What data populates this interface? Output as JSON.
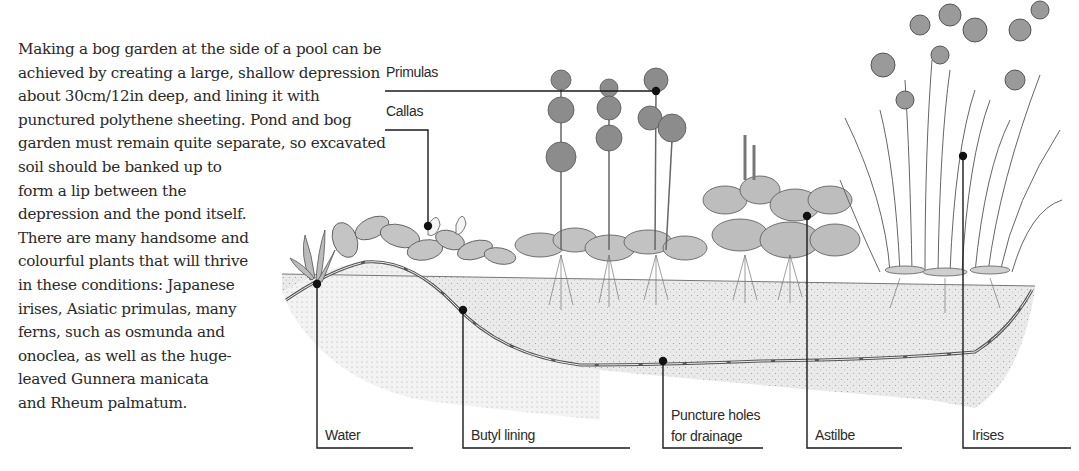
{
  "intro": {
    "lines": [
      "Making a bog garden at the side of a pool can be",
      "achieved by creating a large, shallow depression",
      "about 30cm/12in deep, and lining it with",
      "punctured polythene sheeting. Pond and bog",
      "garden must remain quite separate, so excavated",
      "soil should be banked up to",
      "form a lip between the",
      "depression and the pond itself.",
      "There are many handsome and",
      "colourful plants that will thrive",
      "in these conditions: Japanese",
      "irises, Asiatic primulas, many",
      "ferns, such as osmunda and",
      "onoclea, as well as the huge-",
      "leaved Gunnera manicata",
      "and Rheum palmatum."
    ]
  },
  "labels": {
    "primulas": "Primulas",
    "callas": "Callas",
    "water": "Water",
    "butyl": "Butyl lining",
    "puncture_1": "Puncture holes",
    "puncture_2": "for drainage",
    "astilbe": "Astilbe",
    "irises": "Irises"
  },
  "colors": {
    "ink": "#1a1a1a",
    "soil": "#d9d9d9",
    "foliage": "#9a9a9a"
  }
}
